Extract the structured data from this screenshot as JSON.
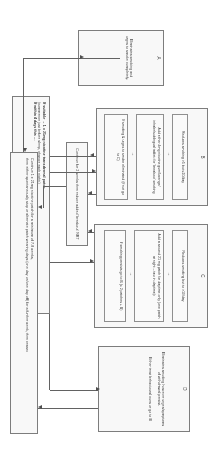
{
  "diagram": {
    "orientation": "landscape artwork rotated 90 degrees within a portrait frame",
    "background_color": "#ffffff",
    "line_color": "#5d5d5d",
    "box_border_color": "#6b6b6b"
  },
  "entry": {
    "name": "start-box",
    "line1": "If suitable → 1 x 21mg nicotine transdermal patch",
    "line2": "(commence just before sleep, change each night¹)",
    "line3": "If within 4 days this …"
  },
  "branches": [
    {
      "id": "A",
      "letter": "A",
      "heading": "Eliminates smoking and",
      "lines": [
        "Eliminates smoking and",
        "urges to smoke completely."
      ]
    },
    {
      "id": "B",
      "letter": "B",
      "lines": [
        "Reduces smoking >5 but ≤10/day",
        "Add either 4mg nicotine gum/lozenge/ inhaler/sublingual tablet³ for 'breakout' smoking",
        "If smoking & urges to smoke eliminated (if not go to C)"
      ],
      "steps": [
        {
          "text": "Reduces smoking >5 but ≤10/day"
        },
        {
          "text": "Add either 4mg nicotine gum/lozenge/ inhaler/sublingual tablet³ for 'breakout' smoking"
        },
        {
          "text": "If smoking & urges to smoke eliminated (if not go to C)"
        }
      ]
    },
    {
      "id": "C",
      "letter": "C",
      "lines": [
        "Reduces smoking but to >10/day",
        "Add a second 21 mg patch for daytime only (one patch at night – two in daytime)²",
        "If smoking persists go to B (≤ 2 patches + B)"
      ],
      "steps": [
        {
          "text": "Reduces smoking but to >10/day"
        },
        {
          "text": "Add a second 21 mg patch for daytime only (one patch at night – two in daytime)²"
        },
        {
          "text": "If smoking persists go to B (≤ 2 patches + B)"
        }
      ]
    },
    {
      "id": "D",
      "letter": "D",
      "lines": [
        "Eliminates smoking however urges/symptoms of withdrawal persist.",
        "Either treat behavioural cues or go to B"
      ],
      "steps": [
        {
          "text": "Eliminates smoking however urges/symptoms of withdrawal persist."
        },
        {
          "text": "Either treat behavioural cues or go to B"
        }
      ]
    }
  ],
  "outcomes": {
    "continue_two_weeks": {
      "name": "continue-two-weeks-box",
      "text": "Continue for 2 weeks then reduce added 'breakout' NRT"
    },
    "maintenance": {
      "name": "maintenance-box",
      "line1": "Continue 1 x 21mg nicotine patch for a minimum of 7-8 weeks,",
      "line2": "then either spontaneously stop or alternate patch wearing days (one day on/one day off) for a further week, then cease²"
    }
  },
  "icons": {
    "right_arrow": "→",
    "arrowhead": "▶"
  }
}
